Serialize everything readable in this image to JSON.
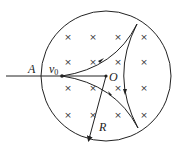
{
  "diagram": {
    "labels": {
      "A": "A",
      "v": "v",
      "v_sub": "0",
      "O": "O",
      "R": "R"
    },
    "field_symbol": "×",
    "field_marks": [
      [
        68,
        37
      ],
      [
        93,
        37
      ],
      [
        118,
        37
      ],
      [
        144,
        37
      ],
      [
        68,
        62
      ],
      [
        93,
        62
      ],
      [
        118,
        62
      ],
      [
        144,
        62
      ],
      [
        68,
        88
      ],
      [
        93,
        88
      ],
      [
        118,
        88
      ],
      [
        144,
        88
      ],
      [
        68,
        115
      ],
      [
        93,
        115
      ],
      [
        118,
        115
      ],
      [
        144,
        115
      ]
    ],
    "colors": {
      "stroke": "#222222"
    }
  }
}
